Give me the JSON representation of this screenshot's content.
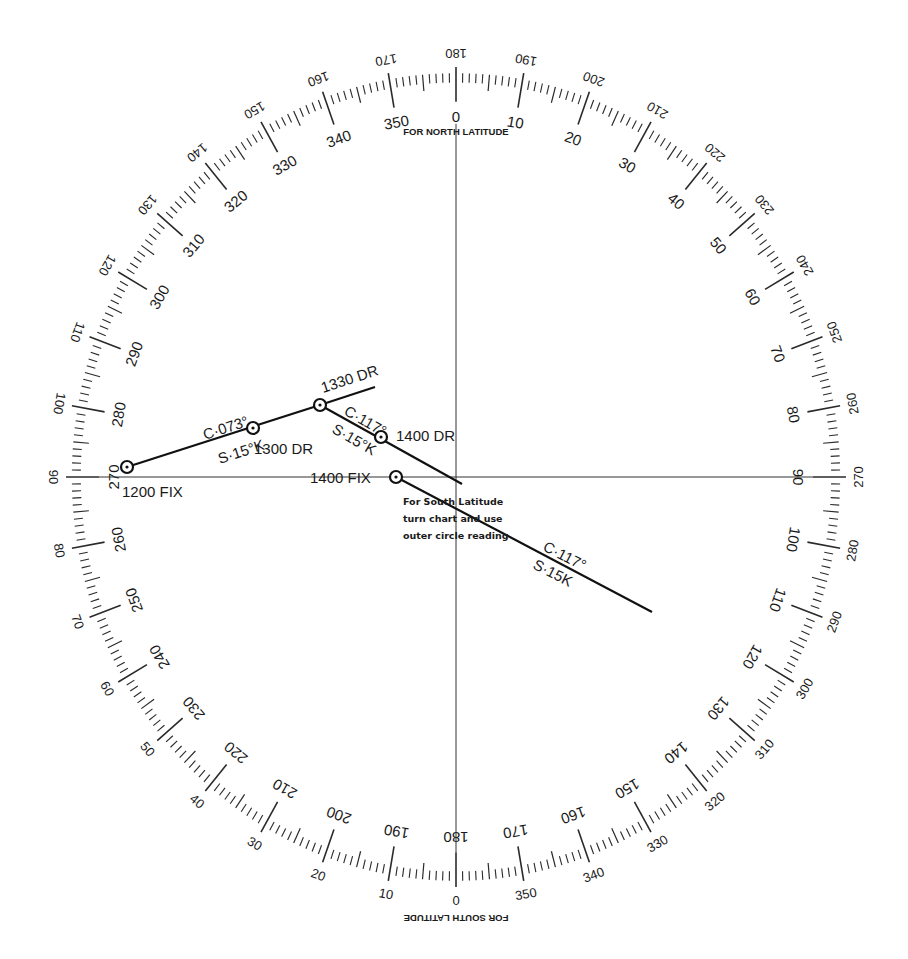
{
  "diagram": {
    "compass_rose": {
      "center": [
        456,
        477
      ],
      "radius_x": 390,
      "radius_y": 410,
      "inner_scale_label": "FOR NORTH LATITUDE",
      "outer_scale_label": "FOR SOUTH LATITUDE",
      "inner_labels_every_deg": 10,
      "outer_offset_deg": 180,
      "tick_minor_deg": 1,
      "tick_mid_deg": 5,
      "tick_major_deg": 10
    },
    "axes": {
      "horizontal_line": true,
      "vertical_line": true
    },
    "points": [
      {
        "id": "fix1200",
        "label": "1200 FIX",
        "x": 127,
        "y": 467
      },
      {
        "id": "dr1300",
        "label": "1300 DR",
        "x": 253,
        "y": 428
      },
      {
        "id": "dr1330",
        "label": "1330 DR",
        "x": 320,
        "y": 405
      },
      {
        "id": "dr1400",
        "label": "1400 DR",
        "x": 381,
        "y": 437
      },
      {
        "id": "fix1400",
        "label": "1400 FIX",
        "x": 396,
        "y": 477
      }
    ],
    "tracks": [
      {
        "from": [
          127,
          467
        ],
        "to": [
          320,
          405
        ],
        "course": "C·073°",
        "speed": "S·15°K"
      },
      {
        "from": [
          320,
          405
        ],
        "to": [
          375,
          387
        ],
        "course": "",
        "speed": ""
      },
      {
        "from": [
          320,
          405
        ],
        "to": [
          462,
          484
        ],
        "course": "C·117°",
        "speed": "S·15°K"
      },
      {
        "from": [
          396,
          477
        ],
        "to": [
          652,
          612
        ],
        "course": "C·117°",
        "speed": "S·15K"
      }
    ],
    "annotations": [
      {
        "text": "C·073°",
        "x": 205,
        "y": 440,
        "rotate": -18
      },
      {
        "text": "S·15°K",
        "x": 220,
        "y": 464,
        "rotate": -18
      },
      {
        "text": "1300 DR",
        "x": 254,
        "y": 454,
        "rotate": 0
      },
      {
        "text": "1330 DR",
        "x": 323,
        "y": 393,
        "rotate": -18
      },
      {
        "text": "C·117°",
        "x": 343,
        "y": 414,
        "rotate": 30
      },
      {
        "text": "S·15°K",
        "x": 331,
        "y": 432,
        "rotate": 30
      },
      {
        "text": "1400 DR",
        "x": 396,
        "y": 441,
        "rotate": 0
      },
      {
        "text": "1400 FIX",
        "x": 310,
        "y": 483,
        "rotate": 0
      },
      {
        "text": "1200 FIX",
        "x": 122,
        "y": 497,
        "rotate": 0
      },
      {
        "text": "C·117°",
        "x": 542,
        "y": 550,
        "rotate": 27
      },
      {
        "text": "S·15K",
        "x": 532,
        "y": 568,
        "rotate": 27
      }
    ],
    "note": {
      "lines": [
        "For South Latitude",
        "turn chart and use",
        "outer circle reading"
      ],
      "x": 403,
      "y": 505
    }
  }
}
